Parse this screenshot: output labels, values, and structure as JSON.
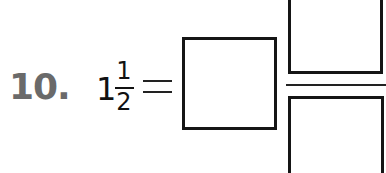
{
  "problem": {
    "number": "10.",
    "mixed_number": {
      "whole": "1",
      "numerator": "1",
      "denominator": "2"
    },
    "operator": "=",
    "answer": {
      "whole_box": "",
      "numerator_box": "",
      "denominator_box": ""
    }
  },
  "colors": {
    "number_label": "#6a6a6a",
    "text": "#111111",
    "box_border": "#151515"
  }
}
